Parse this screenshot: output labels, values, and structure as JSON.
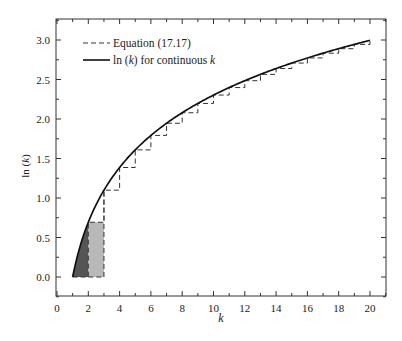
{
  "chart_data": {
    "type": "line",
    "title": "",
    "xlabel": "k",
    "ylabel": "ln (k)",
    "xlim": [
      0,
      21
    ],
    "ylim": [
      -0.25,
      3.25
    ],
    "x_ticks": [
      0,
      2,
      4,
      6,
      8,
      10,
      12,
      14,
      16,
      18,
      20
    ],
    "x_tick_labels": [
      "0",
      "2",
      "4",
      "6",
      "8",
      "10",
      "12",
      "14",
      "16",
      "18",
      "20"
    ],
    "y_ticks": [
      0.0,
      0.5,
      1.0,
      1.5,
      2.0,
      2.5,
      3.0
    ],
    "y_tick_labels": [
      "0.0",
      "0.5",
      "1.0",
      "1.5",
      "2.0",
      "2.5",
      "3.0"
    ],
    "grid": false,
    "legend_position": "upper left",
    "series": [
      {
        "name": "Equation (17.17)",
        "style": "dashed step",
        "description": "Step function with value ln(n) on interval [n, n+1], starting at k=2 and ending at k=20",
        "x": [
          2,
          3,
          4,
          5,
          6,
          7,
          8,
          9,
          10,
          11,
          12,
          13,
          14,
          15,
          16,
          17,
          18,
          19,
          20
        ],
        "values": [
          0.693,
          1.099,
          1.386,
          1.609,
          1.792,
          1.946,
          2.079,
          2.197,
          2.303,
          2.398,
          2.485,
          2.565,
          2.639,
          2.708,
          2.773,
          2.833,
          2.89,
          2.944,
          2.996
        ]
      },
      {
        "name": "ln (k) for continuous k",
        "style": "solid",
        "x_range": [
          1,
          20
        ],
        "function": "ln(k)"
      }
    ],
    "annotations": [
      {
        "type": "shaded-area",
        "description": "Dark gray area under ln(k) curve from k=1 to k=2",
        "x_range": [
          1,
          2
        ],
        "color": "#555555"
      },
      {
        "type": "shaded-rect",
        "description": "Light gray rectangle from k=2 to k=3 with height ln(2)",
        "x_range": [
          2,
          3
        ],
        "height": 0.693,
        "color": "#b8b8b8"
      }
    ]
  },
  "legend": {
    "items": [
      {
        "label": "Equation (17.17)"
      },
      {
        "label": "ln (k) for continuous k"
      }
    ]
  },
  "axes": {
    "xlabel": "k",
    "ylabel": "ln (k)"
  }
}
